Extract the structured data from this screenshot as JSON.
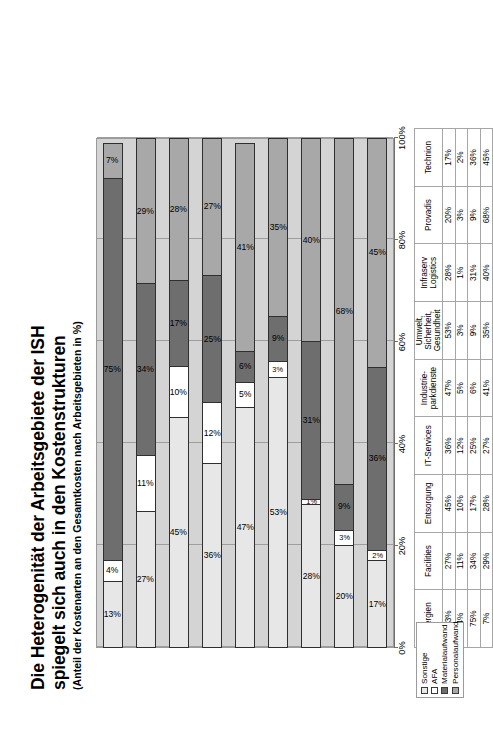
{
  "title": {
    "line1": "Die Heterogenität der Arbeitsgebiete der ISH",
    "line2": "spiegelt sich auch in den Kostenstrukturen",
    "subtitle": "(Anteil der Kostenarten an den Gesamtkosten nach Arbeitsgebieten in %)"
  },
  "legend": {
    "items": [
      {
        "label": "Sonstige",
        "color": "#e7e7e7"
      },
      {
        "label": "AFA",
        "color": "#ffffff"
      },
      {
        "label": "Materialaufwand",
        "color": "#6e6e6e"
      },
      {
        "label": "Personalaufwand",
        "color": "#a8a8a8"
      }
    ]
  },
  "chart_data": {
    "type": "bar",
    "orientation": "stacked-horizontal-rotated",
    "title": "Die Heterogenität der Arbeitsgebiete der ISH spiegelt sich auch in den Kostenstrukturen",
    "subtitle": "(Anteil der Kostenarten an den Gesamtkosten nach Arbeitsgebieten in %)",
    "xlabel": "",
    "ylabel": "",
    "ylim": [
      0,
      100
    ],
    "yticks": [
      "0%",
      "20%",
      "40%",
      "60%",
      "80%",
      "100%"
    ],
    "grid": true,
    "legend_position": "bottom-left",
    "categories": [
      "Energien",
      "Facilities",
      "Entsorgung",
      "IT-Services",
      "Industrie-\npark­dienste",
      "Umwelt,\nSicherheit,\nGesundheit",
      "Infraserv\nLogistics",
      "Provadis",
      "Technion"
    ],
    "category_lines": [
      [
        "Energien"
      ],
      [
        "Facilities"
      ],
      [
        "Entsorgung"
      ],
      [
        "IT-Services"
      ],
      [
        "Industrie-",
        "parkdienste"
      ],
      [
        "Umwelt,",
        "Sicherheit,",
        "Gesundheit"
      ],
      [
        "Infraserv",
        "Logistics"
      ],
      [
        "Provadis"
      ],
      [
        "Technion"
      ]
    ],
    "series": [
      {
        "name": "Sonstige",
        "color": "#e7e7e7",
        "values": [
          13,
          27,
          45,
          36,
          47,
          53,
          28,
          20,
          17
        ],
        "labels": [
          "13%",
          "27%",
          "45%",
          "36%",
          "47%",
          "53%",
          "28%",
          "20%",
          "17%"
        ]
      },
      {
        "name": "AFA",
        "color": "#ffffff",
        "values": [
          4,
          11,
          10,
          12,
          5,
          3,
          1,
          3,
          2
        ],
        "labels": [
          "4%",
          "11%",
          "10%",
          "12%",
          "5%",
          "3%",
          "1%",
          "3%",
          "2%"
        ]
      },
      {
        "name": "Materialaufwand",
        "color": "#6e6e6e",
        "values": [
          75,
          34,
          17,
          25,
          6,
          9,
          31,
          9,
          36
        ],
        "labels": [
          "75%",
          "34%",
          "17%",
          "25%",
          "6%",
          "9%",
          "31%",
          "9%",
          "36%"
        ]
      },
      {
        "name": "Personalaufwand",
        "color": "#a8a8a8",
        "values": [
          7,
          29,
          28,
          27,
          41,
          35,
          40,
          68,
          45
        ],
        "labels": [
          "7%",
          "29%",
          "28%",
          "27%",
          "41%",
          "35%",
          "40%",
          "68%",
          "45%"
        ]
      }
    ]
  },
  "table": {
    "row_labels": [
      "Sonstige",
      "AFA",
      "Materialaufwand",
      "Personalaufwand"
    ]
  }
}
